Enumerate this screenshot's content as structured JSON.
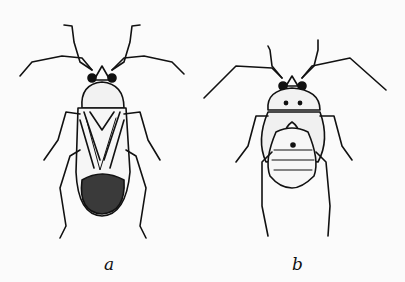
{
  "figure": {
    "panels": [
      {
        "id": "a",
        "label": "a",
        "subject": "adult-bug-illustration"
      },
      {
        "id": "b",
        "label": "b",
        "subject": "nymph-bug-illustration"
      }
    ],
    "colors": {
      "ink": "#111111",
      "paper": "#fbfbfb"
    }
  }
}
